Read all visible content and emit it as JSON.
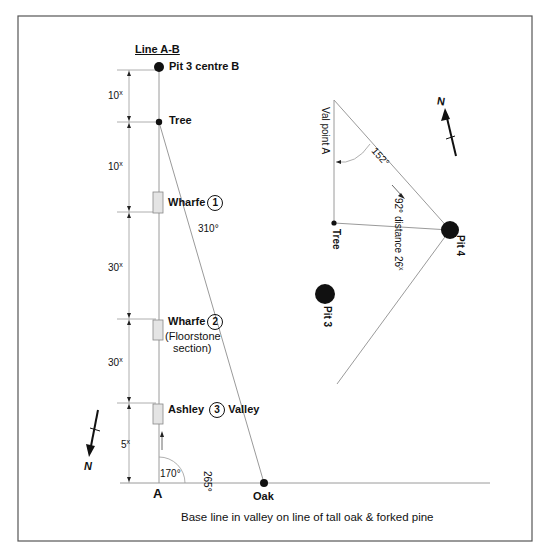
{
  "title": "Line A-B",
  "caption": "Base line in valley on line of tall oak & forked pine",
  "line_ab": {
    "points": [
      {
        "id": "B",
        "label": "Pit 3 centre B"
      },
      {
        "id": "tree",
        "label": "Tree"
      },
      {
        "id": "wharfe1",
        "label": "Wharfe",
        "number": "1"
      },
      {
        "id": "wharfe2",
        "label": "Wharfe",
        "number": "2",
        "note_line1": "(Floorstone",
        "note_line2": "section)"
      },
      {
        "id": "ashley3",
        "label_left": "Ashley",
        "number": "3",
        "label_right": "Valley"
      },
      {
        "id": "A",
        "label": "A"
      },
      {
        "id": "oak",
        "label": "Oak"
      }
    ],
    "dimensions": [
      {
        "value": "10",
        "unit": "x"
      },
      {
        "value": "10",
        "unit": "x"
      },
      {
        "value": "30",
        "unit": "x"
      },
      {
        "value": "30",
        "unit": "x"
      },
      {
        "value": "5",
        "unit": "x"
      }
    ],
    "angles": {
      "tree_to_oak": "310°",
      "at_A": "170°",
      "baseline": "265°"
    }
  },
  "pit4_survey": {
    "val_point": "Val point A",
    "angle_apex": "152°",
    "bearing_distance": "92° distance 26",
    "distance_unit": "x",
    "tree": "Tree",
    "pit4": "Pit 4",
    "pit3": "Pit 3"
  },
  "north_arrows": [
    {
      "label": "N",
      "position": "top-right"
    },
    {
      "label": "N",
      "position": "bottom-left"
    }
  ],
  "colors": {
    "ink": "#111111",
    "line": "#9a9a9a",
    "frame": "#555555",
    "feature_fill": "#e4e4e4"
  }
}
